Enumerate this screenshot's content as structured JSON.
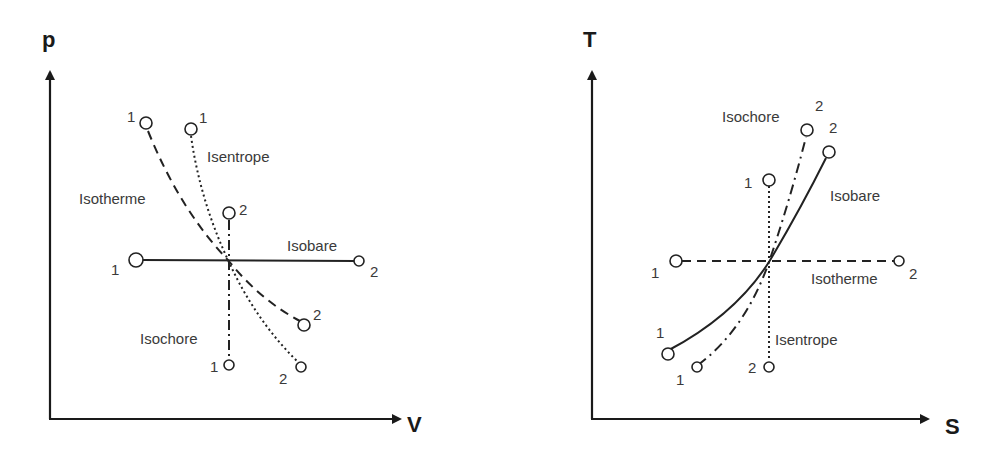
{
  "left_diagram": {
    "title": "p-V diagram",
    "y_axis_label": "p",
    "x_axis_label": "V",
    "curves": [
      {
        "name": "Isotherme",
        "style": "dashed",
        "start_label": "1",
        "end_label": "2"
      },
      {
        "name": "Isentrope",
        "style": "dotted",
        "start_label": "1",
        "end_label": "2"
      },
      {
        "name": "Isobare",
        "style": "solid",
        "start_label": "1",
        "end_label": "2"
      },
      {
        "name": "Isochore",
        "style": "dash-dot",
        "start_label": "1",
        "end_label": "2"
      }
    ]
  },
  "right_diagram": {
    "title": "T-S diagram",
    "y_axis_label": "T",
    "x_axis_label": "S",
    "curves": [
      {
        "name": "Isochore",
        "style": "dash-dot",
        "start_label": "1",
        "end_label": "2"
      },
      {
        "name": "Isobare",
        "style": "solid",
        "start_label": "1",
        "end_label": "2"
      },
      {
        "name": "Isotherme",
        "style": "dashed",
        "start_label": "1",
        "end_label": "2"
      },
      {
        "name": "Isentrope",
        "style": "dotted",
        "start_label": "1",
        "end_label": "2"
      }
    ]
  },
  "colors": {
    "line": "#222222",
    "text": "#3a3a3a"
  }
}
